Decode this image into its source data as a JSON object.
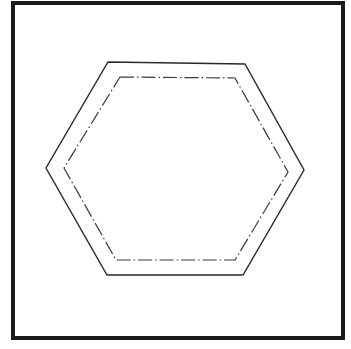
{
  "figure": {
    "colors": {
      "background": "#ffffff",
      "frame": "#1a1a1a",
      "outline": "#2a2a2a",
      "inner_outline": "#3a3a3a"
    },
    "frame": {
      "x": 13,
      "y": 3,
      "width": 330,
      "height": 335,
      "stroke_width": 4
    },
    "outer_hexagon": {
      "style": "solid",
      "stroke_width": 1.4,
      "points": "108,62 245,64 304,170 243,275 107,275 46,168"
    },
    "inner_hexagon": {
      "style": "dash-dot",
      "stroke_width": 1.2,
      "dasharray": "14 3 1.5 3",
      "points": "120,77 235,78 288,172 235,260 116,260 64,168"
    }
  }
}
